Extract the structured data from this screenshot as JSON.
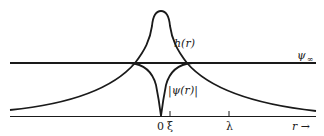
{
  "diagram": {
    "curves": [
      {
        "id": "h",
        "label": "h(r)"
      },
      {
        "id": "psi",
        "label": "|ψ(r)|"
      },
      {
        "id": "psi_inf",
        "label": "ψ",
        "subscript": "∞"
      }
    ],
    "axis": {
      "variable": "r",
      "arrow": "→",
      "ticks": [
        {
          "label": "0"
        },
        {
          "label": "ξ"
        },
        {
          "label": "λ"
        }
      ]
    },
    "colors": {
      "stroke": "#1a1a1a",
      "background": "#ffffff"
    }
  }
}
